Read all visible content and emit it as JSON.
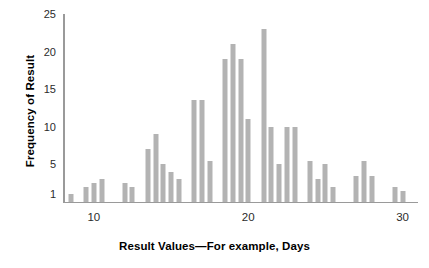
{
  "chart_data": {
    "type": "bar",
    "title": "",
    "xlabel": "Result Values—For example, Days",
    "ylabel": "Frequency of Result",
    "grid": false,
    "legend": null,
    "xlim": [
      8.0,
      31.0
    ],
    "ylim": [
      0,
      25
    ],
    "xticks": [
      10,
      20,
      30
    ],
    "yticks": [
      1,
      5,
      10,
      15,
      20,
      25
    ],
    "bar_color": "#b3b3b3",
    "axis_color": "#9a9a9a",
    "bin_width": 0.5,
    "x": [
      8.5,
      9.5,
      10.0,
      10.5,
      11.0,
      12.0,
      12.5,
      13.0,
      13.5,
      14.0,
      14.5,
      15.0,
      15.5,
      16.0,
      16.5,
      17.0,
      17.5,
      18.0,
      18.5,
      19.0,
      19.5,
      20.0,
      20.5,
      21.0,
      21.5,
      22.0,
      22.5,
      23.0,
      23.5,
      24.0,
      24.5,
      25.0,
      25.5,
      26.0,
      27.0,
      27.5,
      28.0,
      29.5,
      30.0
    ],
    "values": [
      1,
      2,
      2.5,
      3,
      3,
      2.5,
      2,
      2,
      2,
      7,
      9,
      5,
      4,
      3,
      13.5,
      13.5,
      13.5,
      5.5,
      19,
      21,
      19,
      11,
      23,
      23,
      10,
      5,
      10,
      10,
      10,
      5.5,
      3,
      5,
      2,
      3.5,
      5.5,
      3.5,
      3.5,
      2,
      1.5
    ],
    "bars": [
      {
        "x": 8.5,
        "value": 1
      },
      {
        "x": 9.5,
        "value": 2
      },
      {
        "x": 10.0,
        "value": 2.5
      },
      {
        "x": 10.5,
        "value": 3
      },
      {
        "x": 12.0,
        "value": 2.5
      },
      {
        "x": 12.5,
        "value": 2
      },
      {
        "x": 13.5,
        "value": 7
      },
      {
        "x": 14.0,
        "value": 9
      },
      {
        "x": 14.5,
        "value": 5
      },
      {
        "x": 15.0,
        "value": 4
      },
      {
        "x": 15.5,
        "value": 3
      },
      {
        "x": 16.5,
        "value": 13.5
      },
      {
        "x": 17.0,
        "value": 13.5
      },
      {
        "x": 17.5,
        "value": 5.5
      },
      {
        "x": 18.5,
        "value": 19
      },
      {
        "x": 19.0,
        "value": 21
      },
      {
        "x": 19.5,
        "value": 19
      },
      {
        "x": 20.0,
        "value": 11
      },
      {
        "x": 21.0,
        "value": 23
      },
      {
        "x": 21.5,
        "value": 10
      },
      {
        "x": 22.0,
        "value": 5
      },
      {
        "x": 22.5,
        "value": 10
      },
      {
        "x": 23.0,
        "value": 10
      },
      {
        "x": 24.0,
        "value": 5.5
      },
      {
        "x": 24.5,
        "value": 3
      },
      {
        "x": 25.0,
        "value": 5
      },
      {
        "x": 25.5,
        "value": 2
      },
      {
        "x": 27.0,
        "value": 3.5
      },
      {
        "x": 27.5,
        "value": 5.5
      },
      {
        "x": 28.0,
        "value": 3.5
      },
      {
        "x": 29.5,
        "value": 2
      },
      {
        "x": 30.0,
        "value": 1.5
      }
    ]
  }
}
